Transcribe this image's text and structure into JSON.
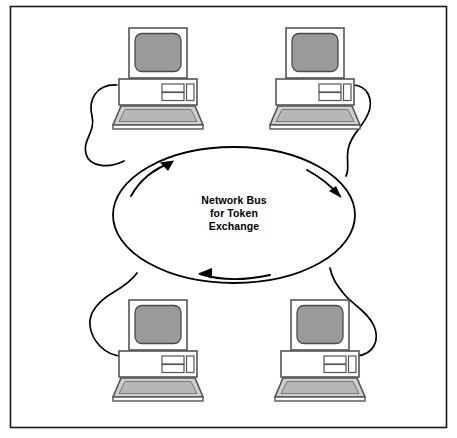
{
  "diagram": {
    "frame": {
      "name": "outer-border",
      "x": 10,
      "y": 6,
      "width": 437,
      "height": 422,
      "stroke_color": "#1a1a1a",
      "fill_color": "#ffffff"
    },
    "bus": {
      "name": "network-bus-ellipse",
      "label_lines": [
        "Network Bus",
        "for Token",
        "Exchange"
      ],
      "center_x": 234,
      "center_y": 215,
      "radius_x": 121,
      "radius_y": 68,
      "stroke_color": "#000000",
      "fill_color": "#ffffff",
      "text_color": "#000000"
    },
    "flow_arrows": [
      {
        "name": "flow-arrow-upper-left",
        "direction": "up-right",
        "position": "upper-left"
      },
      {
        "name": "flow-arrow-upper-right",
        "direction": "down-right",
        "position": "upper-right"
      },
      {
        "name": "flow-arrow-bottom",
        "direction": "left",
        "position": "bottom-center"
      }
    ],
    "colors": {
      "outline": "#333333",
      "screen_gray": "#9a9a9a",
      "body_white": "#ffffff",
      "keyboard_gray": "#c9c9c9",
      "keyboard_inner_gray": "#b4b4b4",
      "cable": "#000000",
      "background": "#ffffff"
    },
    "workstations": [
      {
        "name": "workstation-top-left",
        "position": "top-left",
        "x": 115,
        "y": 28,
        "cable_side": "left",
        "screen_label": "",
        "parts": [
          "monitor",
          "screen",
          "system-body",
          "drive-slot-upper",
          "drive-slot-lower",
          "vertical-slot",
          "keyboard"
        ]
      },
      {
        "name": "workstation-top-right",
        "position": "top-right",
        "x": 272,
        "y": 28,
        "cable_side": "right",
        "screen_label": "",
        "parts": [
          "monitor",
          "screen",
          "system-body",
          "drive-slot-upper",
          "drive-slot-lower",
          "vertical-slot",
          "keyboard"
        ]
      },
      {
        "name": "workstation-bottom-left",
        "position": "bottom-left",
        "x": 115,
        "y": 300,
        "cable_side": "left",
        "screen_label": "",
        "parts": [
          "monitor",
          "screen",
          "system-body",
          "drive-slot-upper",
          "drive-slot-lower",
          "vertical-slot",
          "keyboard"
        ]
      },
      {
        "name": "workstation-bottom-right",
        "position": "bottom-right",
        "x": 277,
        "y": 300,
        "cable_side": "right",
        "screen_label": "",
        "parts": [
          "monitor",
          "screen",
          "system-body",
          "drive-slot-upper",
          "drive-slot-lower",
          "vertical-slot",
          "keyboard"
        ]
      }
    ],
    "cables": [
      {
        "name": "cable-top-left",
        "from": "workstation-top-left",
        "to": "network-bus-ellipse"
      },
      {
        "name": "cable-top-right",
        "from": "workstation-top-right",
        "to": "network-bus-ellipse"
      },
      {
        "name": "cable-bottom-left",
        "from": "workstation-bottom-left",
        "to": "network-bus-ellipse"
      },
      {
        "name": "cable-bottom-right",
        "from": "workstation-bottom-right",
        "to": "network-bus-ellipse"
      }
    ]
  }
}
